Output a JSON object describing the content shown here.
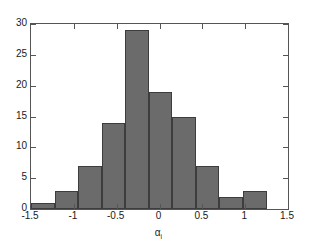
{
  "chart_data": {
    "type": "bar",
    "title": "",
    "subtitle": "",
    "xlabel": "α",
    "xlabel_subscript": "i",
    "ylabel": "",
    "xlim": [
      -1.5,
      1.5
    ],
    "ylim": [
      0,
      30
    ],
    "grid": false,
    "legend": null,
    "bin_width": 0.275,
    "bin_edges": [
      -1.5,
      -1.225,
      -0.95,
      -0.675,
      -0.4,
      -0.125,
      0.15,
      0.425,
      0.7,
      0.975,
      1.25
    ],
    "categories": [
      "-1.50 to -1.23",
      "-1.23 to -0.95",
      "-0.95 to -0.68",
      "-0.68 to -0.40",
      "-0.40 to -0.13",
      "-0.13 to 0.15",
      "0.15 to 0.43",
      "0.43 to 0.70",
      "0.70 to 0.98",
      "0.98 to 1.25"
    ],
    "values": [
      1,
      3,
      7,
      14,
      29,
      19,
      15,
      7,
      2,
      3
    ],
    "xticks": [
      -1.5,
      -1,
      -0.5,
      0,
      0.5,
      1,
      1.5
    ],
    "xticklabels": [
      "-1.5",
      "-1",
      "-0.5",
      "0",
      "0.5",
      "1",
      "1.5"
    ],
    "yticks": [
      0,
      5,
      10,
      15,
      20,
      25,
      30
    ],
    "yticklabels": [
      "0",
      "5",
      "10",
      "15",
      "20",
      "25",
      "30"
    ],
    "colors": {
      "bar_fill": "#6b6b6b",
      "bar_edge": "#3d3d3d",
      "axis": "#555555",
      "text": "#1a1a1a",
      "background": "#ffffff"
    }
  }
}
